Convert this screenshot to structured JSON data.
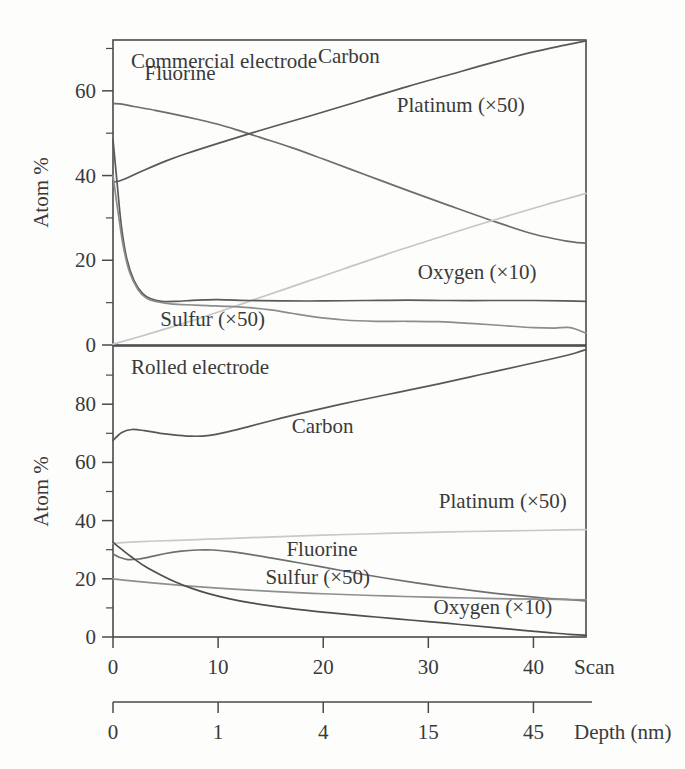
{
  "figure": {
    "background": "#fdfdfc",
    "ink": "#3a3a3a"
  },
  "chart_data": [
    {
      "type": "line",
      "id": "commercial-electrode",
      "title": "Commercial electrode",
      "xlabel": "Scan",
      "ylabel": "Atom %",
      "xlim": [
        0,
        45
      ],
      "ylim": [
        0,
        72
      ],
      "grid": false,
      "legend_position": "inline-annotations",
      "yticks": [
        0,
        20,
        40,
        60
      ],
      "ytick_labels": [
        "0",
        "20",
        "40",
        "60"
      ],
      "yminor": [
        10,
        30,
        50,
        70
      ],
      "xticks": [
        0,
        10,
        20,
        30,
        40
      ],
      "xtick_labels": [
        "0",
        "10",
        "20",
        "30",
        "40"
      ],
      "series": [
        {
          "name": "Fluorine",
          "color": "#6d6d6d",
          "label": "Fluorine",
          "label_x": 3.0,
          "label_y": 62.5,
          "x": [
            0,
            1,
            2,
            4,
            6,
            8,
            10,
            12,
            14,
            17,
            20,
            24,
            28,
            32,
            36,
            40,
            43,
            45
          ],
          "values": [
            57.0,
            56.8,
            56.3,
            55.4,
            54.4,
            53.3,
            52.1,
            50.6,
            49.0,
            46.6,
            43.9,
            40.2,
            36.5,
            32.9,
            29.4,
            26.2,
            24.6,
            24.0
          ]
        },
        {
          "name": "Carbon",
          "color": "#585858",
          "label": "Carbon",
          "label_x": 19.5,
          "label_y": 66.5,
          "x": [
            0,
            0.6,
            1.5,
            3,
            5,
            7,
            10,
            13,
            16,
            20,
            24,
            28,
            32,
            36,
            40,
            43,
            45
          ],
          "values": [
            38.5,
            38.7,
            39.6,
            41.3,
            43.4,
            45.2,
            47.6,
            49.9,
            52.1,
            55.0,
            58.0,
            61.0,
            63.8,
            66.6,
            69.2,
            70.8,
            71.8
          ]
        },
        {
          "name": "Platinum (×50)",
          "color": "#c6c6c6",
          "label": "Platinum (×50)",
          "label_x": 27.0,
          "label_y": 55.0,
          "x": [
            0,
            2,
            5,
            8,
            11,
            14,
            18,
            22,
            26,
            30,
            34,
            38,
            41,
            43,
            45
          ],
          "values": [
            0.2,
            1.6,
            3.8,
            6.1,
            8.6,
            11.2,
            14.6,
            18.0,
            21.4,
            24.6,
            27.8,
            30.8,
            33.0,
            34.4,
            35.8
          ]
        },
        {
          "name": "Oxygen (×10)",
          "color": "#5a5a5a",
          "label": "Oxygen (×10)",
          "label_x": 29.0,
          "label_y": 15.5,
          "x": [
            0,
            0.4,
            0.8,
            1.3,
            2.0,
            2.8,
            3.6,
            4.6,
            6.0,
            8.0,
            10.0,
            13.0,
            16.0,
            20.0,
            24.0,
            28.0,
            32.0,
            36.0,
            40.0,
            43.0,
            45.0
          ],
          "values": [
            48.5,
            38.0,
            28.0,
            20.5,
            15.2,
            12.2,
            10.9,
            10.3,
            10.3,
            10.6,
            10.7,
            10.5,
            10.4,
            10.4,
            10.5,
            10.6,
            10.5,
            10.5,
            10.5,
            10.4,
            10.3
          ]
        },
        {
          "name": "Sulfur (×50)",
          "color": "#8c8c8c",
          "label": "Sulfur (×50)",
          "label_x": 4.5,
          "label_y": 4.5,
          "x": [
            0,
            0.5,
            1.0,
            1.6,
            2.4,
            3.2,
            4.2,
            5.5,
            7.0,
            9.0,
            11.0,
            13.0,
            15.0,
            17.0,
            19.0,
            22.0,
            25.0,
            28.0,
            31.0,
            34.0,
            37.0,
            40.0,
            42.0,
            43.5,
            45.0
          ],
          "values": [
            40.0,
            31.0,
            23.0,
            17.0,
            13.0,
            11.0,
            10.2,
            9.7,
            9.5,
            9.3,
            9.1,
            8.8,
            8.3,
            7.5,
            6.7,
            5.9,
            5.6,
            5.6,
            5.5,
            5.1,
            4.6,
            4.1,
            4.0,
            4.1,
            2.8
          ]
        }
      ]
    },
    {
      "type": "line",
      "id": "rolled-electrode",
      "title": "Rolled electrode",
      "xlabel": "Scan",
      "ylabel": "Atom %",
      "xlim": [
        0,
        45
      ],
      "ylim": [
        0,
        100
      ],
      "grid": false,
      "legend_position": "inline-annotations",
      "yticks": [
        0,
        20,
        40,
        60,
        80
      ],
      "ytick_labels": [
        "0",
        "20",
        "40",
        "60",
        "80"
      ],
      "yminor": [
        10,
        30,
        50,
        70,
        90
      ],
      "xticks": [
        0,
        10,
        20,
        30,
        40
      ],
      "xtick_labels": [
        "0",
        "10",
        "20",
        "30",
        "40"
      ],
      "series": [
        {
          "name": "Carbon",
          "color": "#585858",
          "label": "Carbon",
          "label_x": 17.0,
          "label_y": 70.0,
          "x": [
            0,
            0.8,
            1.8,
            3.0,
            4.5,
            6.0,
            7.5,
            9.0,
            11.0,
            13.0,
            16.0,
            19.0,
            23.0,
            27.0,
            31.0,
            35.0,
            39.0,
            42.0,
            44.0,
            45.0
          ],
          "values": [
            67.5,
            70.2,
            71.3,
            70.9,
            70.0,
            69.4,
            69.0,
            69.2,
            70.6,
            72.4,
            75.2,
            77.8,
            81.0,
            84.0,
            87.0,
            90.2,
            93.4,
            95.8,
            97.6,
            98.8
          ]
        },
        {
          "name": "Platinum (×50)",
          "color": "#c9c9c9",
          "label": "Platinum (×50)",
          "label_x": 31.0,
          "label_y": 44.5,
          "x": [
            0,
            1.5,
            3.5,
            6.0,
            9.0,
            12.0,
            16.0,
            20.0,
            24.0,
            28.0,
            32.0,
            36.0,
            40.0,
            43.0,
            45.0
          ],
          "values": [
            32.2,
            32.6,
            32.9,
            33.2,
            33.6,
            34.0,
            34.5,
            35.0,
            35.4,
            35.8,
            36.1,
            36.4,
            36.6,
            36.8,
            36.9
          ]
        },
        {
          "name": "Fluorine",
          "color": "#6f6f6f",
          "label": "Fluorine",
          "label_x": 16.5,
          "label_y": 28.0,
          "x": [
            0,
            0.6,
            1.4,
            2.4,
            3.6,
            5.0,
            6.5,
            8.0,
            9.5,
            11.0,
            13.0,
            15.0,
            17.5,
            20.0,
            23.0,
            26.0,
            29.0,
            32.0,
            35.0,
            38.0,
            41.0,
            43.0,
            45.0
          ],
          "values": [
            28.6,
            27.4,
            26.6,
            26.8,
            27.6,
            28.7,
            29.5,
            29.9,
            29.9,
            29.4,
            28.4,
            27.2,
            25.6,
            24.0,
            22.0,
            20.2,
            18.5,
            17.0,
            15.6,
            14.4,
            13.4,
            12.9,
            12.4
          ]
        },
        {
          "name": "Sulfur (×50)",
          "color": "#8f8f8f",
          "label": "Sulfur (×50)",
          "label_x": 14.5,
          "label_y": 18.2,
          "x": [
            0,
            2.0,
            4.0,
            7.0,
            10.0,
            13.0,
            16.0,
            19.0,
            22.0,
            26.0,
            30.0,
            34.0,
            38.0,
            41.0,
            43.0,
            45.0
          ],
          "values": [
            20.0,
            19.2,
            18.5,
            17.6,
            16.8,
            16.1,
            15.5,
            15.0,
            14.6,
            14.1,
            13.7,
            13.4,
            13.1,
            13.0,
            12.9,
            12.8
          ]
        },
        {
          "name": "Oxygen (×10)",
          "color": "#4f4f4f",
          "label": "Oxygen (×10)",
          "label_x": 30.5,
          "label_y": 8.0,
          "x": [
            0,
            0.8,
            1.8,
            3.0,
            4.5,
            6.0,
            7.5,
            9.0,
            11.0,
            13.0,
            15.0,
            18.0,
            21.0,
            24.0,
            27.0,
            30.0,
            33.0,
            36.0,
            39.0,
            41.5,
            43.5,
            45.0
          ],
          "values": [
            32.5,
            30.2,
            27.4,
            24.4,
            21.4,
            18.8,
            16.7,
            15.0,
            13.2,
            11.8,
            10.7,
            9.3,
            8.2,
            7.2,
            6.2,
            5.3,
            4.3,
            3.3,
            2.3,
            1.5,
            0.9,
            0.6
          ]
        }
      ]
    }
  ],
  "scan_axis": {
    "label": "Scan",
    "ticks": [
      "0",
      "10",
      "20",
      "30",
      "40"
    ],
    "positions": [
      0,
      10,
      20,
      30,
      40
    ]
  },
  "depth_axis": {
    "label": "Depth (nm)",
    "ticks": [
      "0",
      "1",
      "4",
      "15",
      "45"
    ],
    "positions": [
      0,
      10,
      20,
      30,
      40
    ]
  }
}
